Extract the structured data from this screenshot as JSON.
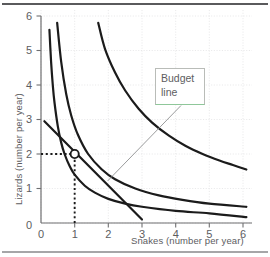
{
  "figure": {
    "title": "",
    "annotation": {
      "label_line1": "Budget",
      "label_line2": "line",
      "border_color": "#b9bcb8",
      "accent_color": "#8fc79a"
    },
    "axis_color": "#6a6a6c",
    "grid_color": "#e4e4e6",
    "curve_color": "#1b1b1b"
  },
  "chart_data": {
    "type": "line",
    "title": "",
    "xlabel": "Snakes (number per year)",
    "ylabel": "Lizards (number per year)",
    "xlim": [
      0,
      6.3
    ],
    "ylim": [
      0,
      6.1
    ],
    "xticks": [
      0,
      1,
      2,
      3,
      4,
      5,
      6
    ],
    "yticks": [
      0,
      1,
      2,
      3,
      4,
      5,
      6
    ],
    "xticklabels": [
      "0",
      "1",
      "2",
      "3",
      "4",
      "5",
      "6"
    ],
    "yticklabels": [
      "0",
      "1",
      "2",
      "3",
      "4",
      "5",
      "6"
    ],
    "grid": true,
    "grid_style": "dotted",
    "legend": "none",
    "series": [
      {
        "name": "Indifference curve I1",
        "type": "hyperbola",
        "constant": 1.4,
        "x_start": 0.25,
        "x_end": 6.1,
        "points": [
          [
            0.25,
            5.6
          ],
          [
            0.3,
            4.67
          ],
          [
            0.35,
            4.0
          ],
          [
            0.4,
            3.5
          ],
          [
            0.5,
            2.8
          ],
          [
            0.6,
            2.33
          ],
          [
            0.7,
            2.0
          ],
          [
            0.85,
            1.65
          ],
          [
            1.0,
            1.4
          ],
          [
            1.3,
            1.08
          ],
          [
            1.6,
            0.88
          ],
          [
            2.0,
            0.7
          ],
          [
            2.5,
            0.56
          ],
          [
            3.0,
            0.47
          ],
          [
            4.0,
            0.35
          ],
          [
            5.0,
            0.28
          ],
          [
            6.1,
            0.17
          ]
        ]
      },
      {
        "name": "Indifference curve I2",
        "type": "hyperbola",
        "constant": 2.8,
        "x_start": 0.48,
        "x_end": 6.1,
        "points": [
          [
            0.48,
            5.8
          ],
          [
            0.6,
            4.67
          ],
          [
            0.75,
            3.73
          ],
          [
            0.9,
            3.11
          ],
          [
            1.1,
            2.55
          ],
          [
            1.4,
            2.0
          ],
          [
            1.8,
            1.56
          ],
          [
            2.2,
            1.27
          ],
          [
            2.8,
            1.0
          ],
          [
            3.5,
            0.8
          ],
          [
            4.2,
            0.67
          ],
          [
            5.0,
            0.56
          ],
          [
            6.1,
            0.47
          ]
        ]
      },
      {
        "name": "Indifference curve I3",
        "type": "hyperbola",
        "constant": 9.6,
        "x_start": 1.7,
        "x_end": 6.1,
        "points": [
          [
            1.7,
            5.8
          ],
          [
            1.9,
            5.05
          ],
          [
            2.2,
            4.36
          ],
          [
            2.5,
            3.84
          ],
          [
            2.9,
            3.31
          ],
          [
            3.3,
            2.91
          ],
          [
            3.8,
            2.53
          ],
          [
            4.3,
            2.23
          ],
          [
            4.8,
            2.0
          ],
          [
            5.3,
            1.81
          ],
          [
            5.7,
            1.68
          ],
          [
            6.1,
            1.55
          ]
        ]
      },
      {
        "name": "Budget line",
        "type": "straight",
        "points": [
          [
            0.1,
            2.95
          ],
          [
            3.0,
            0.1
          ]
        ],
        "x_intercept": 3.0,
        "y_intercept": 3.0
      }
    ],
    "marker_point": {
      "name": "best affordable point",
      "x": 1,
      "y": 2,
      "style": "open-circle",
      "fill": "#ffffff",
      "stroke": "#1b1b1b"
    },
    "guide_lines": [
      {
        "name": "horizontal-dotted-to-y2",
        "from": [
          0,
          2
        ],
        "to": [
          1,
          2
        ]
      },
      {
        "name": "vertical-dotted-to-x1",
        "from": [
          1,
          0
        ],
        "to": [
          1,
          2
        ]
      }
    ],
    "annotations": [
      {
        "text": "Budget line",
        "points_to": [
          1.98,
          1.22
        ],
        "box_at": [
          4.08,
          4.05
        ]
      }
    ]
  }
}
